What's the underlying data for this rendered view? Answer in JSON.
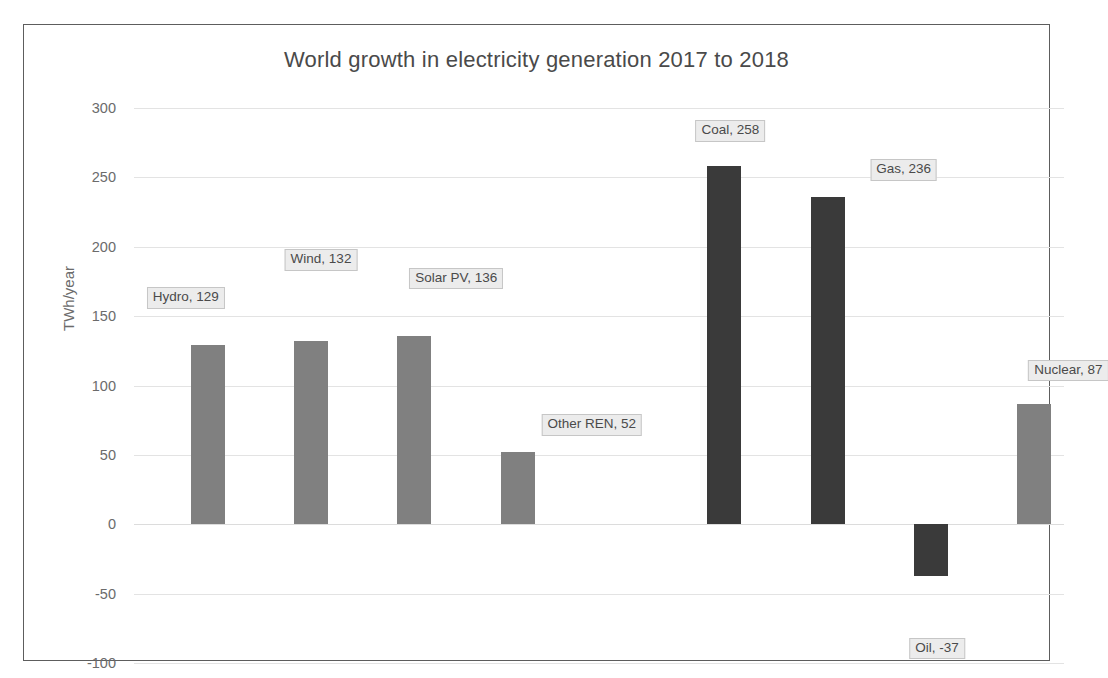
{
  "chart_data": {
    "type": "bar",
    "title": "World growth in electricity generation 2017 to 2018",
    "xlabel": "",
    "ylabel": "TWh/year",
    "ylim": [
      -100,
      300
    ],
    "ytick_labels": [
      "300",
      "250",
      "200",
      "150",
      "100",
      "50",
      "0",
      "-50",
      "-100"
    ],
    "ytick_values": [
      300,
      250,
      200,
      150,
      100,
      50,
      0,
      -50,
      -100
    ],
    "grid": true,
    "legend": "none",
    "categories": [
      "Hydro",
      "Wind",
      "Solar PV",
      "Other REN",
      "Coal",
      "Gas",
      "Oil",
      "Nuclear"
    ],
    "values": [
      129,
      132,
      136,
      52,
      258,
      236,
      -37,
      87
    ],
    "series": [
      {
        "name": "Growth 2017 to 2018",
        "values": [
          129,
          132,
          136,
          52,
          258,
          236,
          -37,
          87
        ]
      }
    ],
    "data_labels": [
      "Hydro, 129",
      "Wind, 132",
      "Solar PV, 136",
      "Other REN, 52",
      "Coal, 258",
      "Gas, 236",
      "Oil, -37",
      "Nuclear, 87"
    ],
    "colors": {
      "renewable_bar": "#808080",
      "fossil_bar": "#3a3a3a",
      "gridline": "#e3e3e3",
      "text": "#4a4a4a",
      "frame": "#5d5d5d",
      "label_box_fill": "#ececec",
      "label_box_border": "#c6c6c6"
    },
    "bar_colors": [
      "#808080",
      "#808080",
      "#808080",
      "#808080",
      "#3a3a3a",
      "#3a3a3a",
      "#3a3a3a",
      "#808080"
    ]
  }
}
